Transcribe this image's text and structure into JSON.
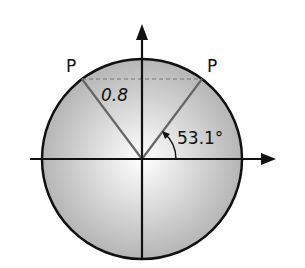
{
  "diagram": {
    "type": "unit-circle",
    "labels": {
      "point_left": "P",
      "point_right": "P",
      "height": "0.8",
      "angle": "53.1°"
    },
    "colors": {
      "fill_center": "#ffffff",
      "fill_edge": "#b8b8b8",
      "stroke": "#111111",
      "radius_line": "#666666",
      "dashed": "#777777"
    }
  }
}
